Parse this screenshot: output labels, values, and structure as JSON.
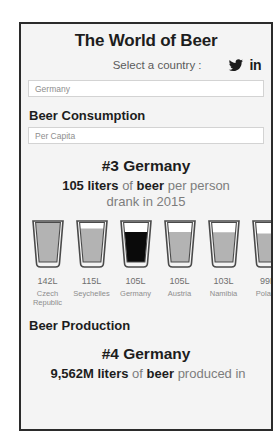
{
  "header": {
    "title": "The World of Beer",
    "select_label": "Select a country :",
    "social": {
      "twitter_icon": "twitter-icon",
      "linkedin_label": "in"
    }
  },
  "country_field": {
    "value": "Germany",
    "placeholder": "Germany"
  },
  "consumption": {
    "heading": "Beer Consumption",
    "metric_field": {
      "value": "Per Capita",
      "placeholder": "Per Capita"
    },
    "rank_line": "#3 Germany",
    "stat_prefix": "105 liters",
    "stat_mid": " of ",
    "stat_bold2": "beer",
    "stat_suffix": " per person",
    "stat_line2": "drank in 2015"
  },
  "production": {
    "heading": "Beer Production",
    "rank_line": "#4 Germany",
    "stat_prefix": "9,562M liters",
    "stat_mid": " of ",
    "stat_bold2": "beer",
    "stat_suffix": " produced in"
  },
  "colors": {
    "beer_fill": "#b3b3b3",
    "beer_fill_selected": "#0a0a0a",
    "glass_outline": "#4a4a4a",
    "frame_border": "#2b2b2b",
    "page_bg": "#f4f4f4",
    "muted_text": "#7d7d7d"
  },
  "chart_data": {
    "type": "bar",
    "title": "Beer Consumption Per Capita",
    "xlabel": "",
    "ylabel": "Liters per person",
    "unit": "L",
    "year": 2015,
    "highlight_index": 2,
    "ylim": [
      0,
      142
    ],
    "grid": false,
    "legend": "none",
    "categories": [
      "Czech Republic",
      "Seychelles",
      "Germany",
      "Austria",
      "Namibia",
      "Poland"
    ],
    "values": [
      142,
      115,
      105,
      105,
      103,
      99
    ],
    "value_labels": [
      "142L",
      "115L",
      "105L",
      "105L",
      "103L",
      "99L"
    ],
    "fill_fractions": [
      1.0,
      0.82,
      0.74,
      0.74,
      0.73,
      0.7
    ]
  }
}
